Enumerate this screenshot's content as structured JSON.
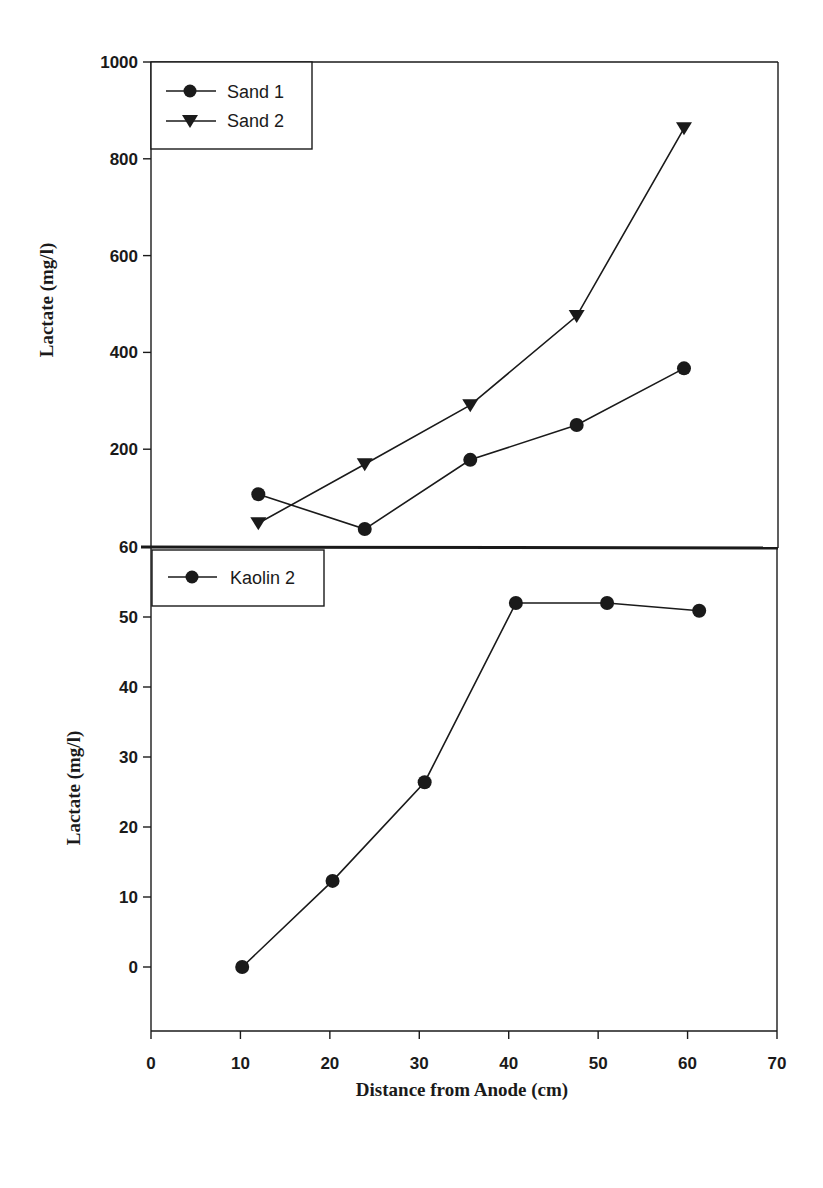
{
  "chart_data": [
    {
      "type": "line",
      "title": "",
      "xlabel": "",
      "ylabel": "Lactate (mg/l)",
      "xlim": [
        0,
        70
      ],
      "ylim": [
        0,
        1000
      ],
      "y_ticks": [
        200,
        400,
        600,
        800,
        1000
      ],
      "grid": false,
      "legend_position": "upper-left",
      "series": [
        {
          "name": "Sand 1",
          "marker": "circle",
          "x": [
            12.0,
            23.9,
            35.7,
            47.6,
            59.6
          ],
          "values": [
            107,
            35,
            178,
            250,
            367
          ]
        },
        {
          "name": "Sand 2",
          "marker": "triangle-down",
          "x": [
            12.0,
            23.9,
            35.7,
            47.6,
            59.6
          ],
          "values": [
            47,
            169,
            291,
            475,
            863
          ]
        }
      ]
    },
    {
      "type": "line",
      "title": "",
      "xlabel": "Distance from Anode (cm)",
      "ylabel": "Lactate (mg/l)",
      "xlim": [
        0,
        70
      ],
      "ylim": [
        -9,
        60
      ],
      "x_ticks": [
        0,
        10,
        20,
        30,
        40,
        50,
        60,
        70
      ],
      "y_ticks": [
        0,
        10,
        20,
        30,
        40,
        50,
        60
      ],
      "grid": false,
      "legend_position": "upper-left",
      "series": [
        {
          "name": "Kaolin 2",
          "marker": "circle",
          "x": [
            10.2,
            20.3,
            30.6,
            40.8,
            51.0,
            61.3
          ],
          "values": [
            0,
            12.3,
            26.4,
            52.0,
            52.0,
            50.9
          ]
        }
      ]
    }
  ],
  "top_plot": {
    "y_tick_labels": [
      "200",
      "400",
      "600",
      "800",
      "1000"
    ],
    "ylabel": "Lactate (mg/l)",
    "legend": [
      "Sand 1",
      "Sand 2"
    ]
  },
  "bottom_plot": {
    "y_tick_labels": [
      "0",
      "10",
      "20",
      "30",
      "40",
      "50",
      "60"
    ],
    "x_tick_labels": [
      "0",
      "10",
      "20",
      "30",
      "40",
      "50",
      "60",
      "70"
    ],
    "ylabel": "Lactate (mg/l)",
    "xlabel": "Distance from Anode (cm)",
    "legend": [
      "Kaolin 2"
    ]
  },
  "colors": {
    "ink": "#1a1a1a",
    "background": "#ffffff"
  }
}
